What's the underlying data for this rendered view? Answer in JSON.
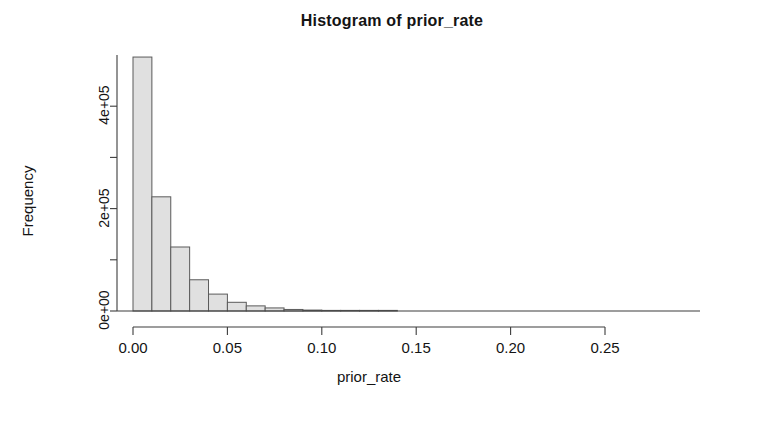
{
  "chart_data": {
    "type": "bar",
    "title": "Histogram of prior_rate",
    "xlabel": "prior_rate",
    "ylabel": "Frequency",
    "xlim": [
      0.0,
      0.25
    ],
    "ylim": [
      0,
      500000
    ],
    "grid": false,
    "legend": null,
    "bin_width": 0.01,
    "x_tick_labels": [
      "0.00",
      "0.05",
      "0.10",
      "0.15",
      "0.20",
      "0.25"
    ],
    "x_tick_values": [
      0.0,
      0.05,
      0.1,
      0.15,
      0.2,
      0.25
    ],
    "y_tick_labels": [
      "0e+00",
      "",
      "2e+05",
      "",
      "4e+05"
    ],
    "y_tick_values": [
      0,
      100000,
      200000,
      300000,
      400000
    ],
    "bin_edges": [
      0.0,
      0.01,
      0.02,
      0.03,
      0.04,
      0.05,
      0.06,
      0.07,
      0.08,
      0.09,
      0.1,
      0.11,
      0.12,
      0.13,
      0.14
    ],
    "categories": [
      "0.00-0.01",
      "0.01-0.02",
      "0.02-0.03",
      "0.03-0.04",
      "0.04-0.05",
      "0.05-0.06",
      "0.06-0.07",
      "0.07-0.08",
      "0.08-0.09",
      "0.09-0.10",
      "0.10-0.11",
      "0.11-0.12",
      "0.12-0.13",
      "0.13-0.14"
    ],
    "values": [
      496000,
      223000,
      125000,
      61000,
      33000,
      17000,
      10000,
      6000,
      3000,
      1800,
      1000,
      600,
      350,
      150
    ],
    "bar_fill_color": "#e0e0e0",
    "bar_border_color": "#5a5a5a",
    "axis_color": "#3c3c3c",
    "background_color": "#ffffff"
  }
}
